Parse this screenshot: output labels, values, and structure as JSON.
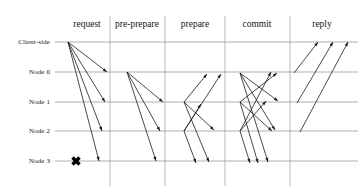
{
  "figure": {
    "type": "sequence-diagram",
    "width": 361,
    "height": 193,
    "background": "#ffffff",
    "line_color": "#8c8c8c",
    "arrow_color": "#1a1a1a",
    "divider_color": "#9a9a9a",
    "fault_marker_color": "#000000"
  },
  "phases": [
    {
      "id": "request",
      "label": "request",
      "center_x": 87,
      "left_x": 62,
      "right_x": 110
    },
    {
      "id": "pre-prepare",
      "label": "pre-prepare",
      "center_x": 137,
      "left_x": 110,
      "right_x": 165
    },
    {
      "id": "prepare",
      "label": "prepare",
      "center_x": 195,
      "left_x": 165,
      "right_x": 225
    },
    {
      "id": "commit",
      "label": "commit",
      "center_x": 257,
      "left_x": 225,
      "right_x": 290
    },
    {
      "id": "reply",
      "label": "reply",
      "center_x": 322,
      "left_x": 290,
      "right_x": 358
    }
  ],
  "phase_label_y": 27,
  "dividers_x": [
    110,
    165,
    225,
    290
  ],
  "divider_top_y": 16,
  "divider_bottom_y": 186,
  "lanes": [
    {
      "id": "client",
      "label": "Client-side",
      "y": 42,
      "label_x": 8,
      "label_width": 42
    },
    {
      "id": "node0",
      "label": "Node 0",
      "y": 72,
      "label_x": 8,
      "label_width": 42
    },
    {
      "id": "node1",
      "label": "Node 1",
      "y": 102,
      "label_x": 8,
      "label_width": 42
    },
    {
      "id": "node2",
      "label": "Node 2",
      "y": 131,
      "label_x": 8,
      "label_width": 42
    },
    {
      "id": "node3",
      "label": "Node 3",
      "y": 161,
      "label_x": 8,
      "label_width": 42
    }
  ],
  "lane_line_x_start": 55,
  "lane_line_x_end": 358,
  "fault_marker": {
    "label": "faulty-node-cross",
    "node": "node3",
    "x": 76,
    "y": 161,
    "size": 7
  },
  "chart_data": {
    "type": "sequence-diagram",
    "lanes": [
      "Client-side",
      "Node 0",
      "Node 1",
      "Node 2",
      "Node 3"
    ],
    "phases": [
      "request",
      "pre-prepare",
      "prepare",
      "commit",
      "reply"
    ],
    "faulty_nodes": [
      "Node 3"
    ],
    "messages": [
      {
        "phase": "request",
        "from": "Client-side",
        "to": "Node 0",
        "x1": 68,
        "y1": 42,
        "x2": 107,
        "y2": 72
      },
      {
        "phase": "request",
        "from": "Client-side",
        "to": "Node 1",
        "x1": 68,
        "y1": 42,
        "x2": 105,
        "y2": 102
      },
      {
        "phase": "request",
        "from": "Client-side",
        "to": "Node 2",
        "x1": 68,
        "y1": 42,
        "x2": 102,
        "y2": 131
      },
      {
        "phase": "request",
        "from": "Client-side",
        "to": "Node 3",
        "x1": 68,
        "y1": 42,
        "x2": 99,
        "y2": 161
      },
      {
        "phase": "pre-prepare",
        "from": "Node 0",
        "to": "Node 1",
        "x1": 127,
        "y1": 72,
        "x2": 163,
        "y2": 102
      },
      {
        "phase": "pre-prepare",
        "from": "Node 0",
        "to": "Node 2",
        "x1": 127,
        "y1": 72,
        "x2": 160,
        "y2": 131
      },
      {
        "phase": "pre-prepare",
        "from": "Node 0",
        "to": "Node 3",
        "x1": 127,
        "y1": 72,
        "x2": 156,
        "y2": 161
      },
      {
        "phase": "prepare",
        "from": "Node 1",
        "to": "Node 0",
        "x1": 184,
        "y1": 102,
        "x2": 207,
        "y2": 74
      },
      {
        "phase": "prepare",
        "from": "Node 1",
        "to": "Node 2",
        "x1": 184,
        "y1": 102,
        "x2": 214,
        "y2": 130
      },
      {
        "phase": "prepare",
        "from": "Node 1",
        "to": "Node 3",
        "x1": 184,
        "y1": 102,
        "x2": 209,
        "y2": 162
      },
      {
        "phase": "prepare",
        "from": "Node 2",
        "to": "Node 0",
        "x1": 184,
        "y1": 131,
        "x2": 221,
        "y2": 74
      },
      {
        "phase": "prepare",
        "from": "Node 2",
        "to": "Node 1",
        "x1": 184,
        "y1": 131,
        "x2": 201,
        "y2": 104
      },
      {
        "phase": "prepare",
        "from": "Node 2",
        "to": "Node 3",
        "x1": 184,
        "y1": 131,
        "x2": 196,
        "y2": 163
      },
      {
        "phase": "commit",
        "from": "Node 0",
        "to": "Node 1",
        "x1": 240,
        "y1": 73,
        "x2": 278,
        "y2": 101
      },
      {
        "phase": "commit",
        "from": "Node 0",
        "to": "Node 2",
        "x1": 240,
        "y1": 73,
        "x2": 275,
        "y2": 130
      },
      {
        "phase": "commit",
        "from": "Node 0",
        "to": "Node 3",
        "x1": 240,
        "y1": 73,
        "x2": 268,
        "y2": 162
      },
      {
        "phase": "commit",
        "from": "Node 1",
        "to": "Node 0",
        "x1": 240,
        "y1": 102,
        "x2": 277,
        "y2": 73
      },
      {
        "phase": "commit",
        "from": "Node 1",
        "to": "Node 2",
        "x1": 240,
        "y1": 102,
        "x2": 272,
        "y2": 131
      },
      {
        "phase": "commit",
        "from": "Node 1",
        "to": "Node 3",
        "x1": 240,
        "y1": 102,
        "x2": 258,
        "y2": 163
      },
      {
        "phase": "commit",
        "from": "Node 2",
        "to": "Node 0",
        "x1": 240,
        "y1": 131,
        "x2": 271,
        "y2": 72
      },
      {
        "phase": "commit",
        "from": "Node 2",
        "to": "Node 1",
        "x1": 240,
        "y1": 131,
        "x2": 266,
        "y2": 101
      },
      {
        "phase": "commit",
        "from": "Node 2",
        "to": "Node 3",
        "x1": 240,
        "y1": 131,
        "x2": 250,
        "y2": 163
      },
      {
        "phase": "reply",
        "from": "Node 0",
        "to": "Client-side",
        "x1": 294,
        "y1": 73,
        "x2": 318,
        "y2": 42
      },
      {
        "phase": "reply",
        "from": "Node 1",
        "to": "Client-side",
        "x1": 297,
        "y1": 103,
        "x2": 333,
        "y2": 42
      },
      {
        "phase": "reply",
        "from": "Node 2",
        "to": "Client-side",
        "x1": 300,
        "y1": 132,
        "x2": 348,
        "y2": 42
      }
    ]
  }
}
